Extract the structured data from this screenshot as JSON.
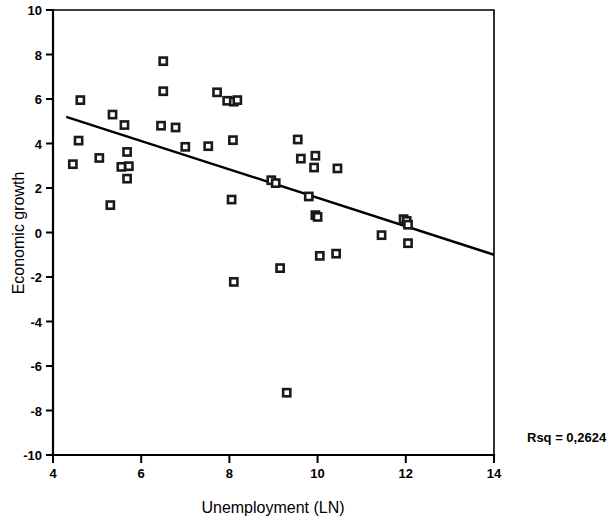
{
  "chart_data": {
    "type": "scatter",
    "title": "",
    "xlabel": "Unemployment (LN)",
    "ylabel": "Economic growth",
    "xlim": [
      4,
      14
    ],
    "ylim": [
      -10,
      10
    ],
    "xticks": [
      4,
      6,
      8,
      10,
      12,
      14
    ],
    "yticks": [
      10,
      8,
      6,
      4,
      2,
      0,
      -2,
      -4,
      -6,
      -8,
      -10
    ],
    "xtick_labels": [
      "4",
      "6",
      "8",
      "10",
      "12",
      "14"
    ],
    "ytick_labels": [
      "10",
      "8",
      "6",
      "4",
      "2",
      "0",
      "-2",
      "-4",
      "-6",
      "-8",
      "-10"
    ],
    "grid": false,
    "legend": null,
    "annotations": [
      {
        "name": "rsq-annotation",
        "text": "Rsq = 0,2624",
        "value": 0.2624,
        "position": "outside-right-bottom"
      }
    ],
    "series": [
      {
        "name": "observations",
        "marker": "open-square",
        "points": [
          [
            4.62,
            5.95
          ],
          [
            4.58,
            4.13
          ],
          [
            4.45,
            3.07
          ],
          [
            5.05,
            3.35
          ],
          [
            5.35,
            5.3
          ],
          [
            5.3,
            1.23
          ],
          [
            5.62,
            4.83
          ],
          [
            5.68,
            3.62
          ],
          [
            5.55,
            2.95
          ],
          [
            5.72,
            2.98
          ],
          [
            5.68,
            2.42
          ],
          [
            6.5,
            7.7
          ],
          [
            6.5,
            6.35
          ],
          [
            6.45,
            4.8
          ],
          [
            6.78,
            4.72
          ],
          [
            7.0,
            3.85
          ],
          [
            7.72,
            6.3
          ],
          [
            7.52,
            3.88
          ],
          [
            7.95,
            5.92
          ],
          [
            8.1,
            5.88
          ],
          [
            8.18,
            5.95
          ],
          [
            8.08,
            4.15
          ],
          [
            8.05,
            1.48
          ],
          [
            8.1,
            -2.22
          ],
          [
            8.95,
            2.35
          ],
          [
            9.05,
            2.22
          ],
          [
            9.15,
            -1.6
          ],
          [
            9.3,
            -7.2
          ],
          [
            9.55,
            4.18
          ],
          [
            9.62,
            3.32
          ],
          [
            9.8,
            1.62
          ],
          [
            9.95,
            3.45
          ],
          [
            9.92,
            2.92
          ],
          [
            9.95,
            0.78
          ],
          [
            10.0,
            0.7
          ],
          [
            10.05,
            -1.05
          ],
          [
            10.45,
            2.88
          ],
          [
            10.42,
            -0.95
          ],
          [
            11.45,
            -0.12
          ],
          [
            11.95,
            0.6
          ],
          [
            12.02,
            0.52
          ],
          [
            12.05,
            0.35
          ],
          [
            12.05,
            -0.48
          ]
        ]
      }
    ],
    "fit_line": {
      "name": "linear-regression-line",
      "x_start": 4.3,
      "y_start": 5.2,
      "x_end": 14.0,
      "y_end": -1.0,
      "slope": -0.639,
      "intercept": 7.95
    }
  },
  "colors": {
    "axis": "#000000",
    "marker_stroke": "#1a1a1a",
    "marker_fill": "#ffffff",
    "fit_line": "#000000",
    "background": "#ffffff"
  }
}
